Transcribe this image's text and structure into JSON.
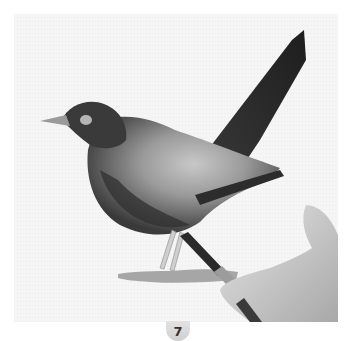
{
  "figure": {
    "step_number": "7",
    "colors": {
      "paper": "#f6f6f6",
      "bird_dark": "#2a2a2a",
      "bird_mid": "#6e6e6e",
      "bird_light": "#bdbdbd",
      "badge": "#d8d8d8",
      "badge_text": "#333333"
    }
  }
}
